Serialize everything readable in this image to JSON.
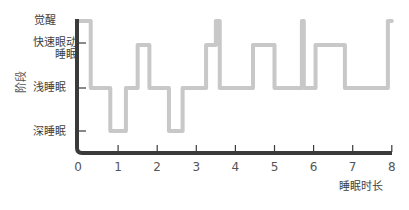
{
  "chart_data": {
    "type": "line",
    "title": "",
    "xlabel": "睡眠时长",
    "ylabel": "阶段",
    "xlim": [
      0,
      8
    ],
    "x_ticks": [
      "0",
      "1",
      "2",
      "3",
      "4",
      "5",
      "6",
      "7",
      "8"
    ],
    "y_categories": [
      "深睡眠",
      "浅睡眠",
      "快速眼动睡眠",
      "觉醒"
    ],
    "y_tick_labels": {
      "awake": "觉醒",
      "rem_line1": "快速眼动",
      "rem_line2": "睡眠",
      "light": "浅睡眠",
      "deep": "深睡眠"
    },
    "grid": false,
    "legend": null,
    "series": [
      {
        "name": "睡眠阶段",
        "color": "#c8c8c8",
        "step_points": [
          {
            "x": 0.0,
            "stage": "觉醒"
          },
          {
            "x": 0.3,
            "stage": "浅睡眠"
          },
          {
            "x": 0.8,
            "stage": "深睡眠"
          },
          {
            "x": 1.2,
            "stage": "浅睡眠"
          },
          {
            "x": 1.5,
            "stage": "快速眼动睡眠"
          },
          {
            "x": 1.8,
            "stage": "浅睡眠"
          },
          {
            "x": 2.3,
            "stage": "深睡眠"
          },
          {
            "x": 2.65,
            "stage": "浅睡眠"
          },
          {
            "x": 3.25,
            "stage": "快速眼动睡眠"
          },
          {
            "x": 3.5,
            "stage": "觉醒"
          },
          {
            "x": 3.6,
            "stage": "浅睡眠"
          },
          {
            "x": 4.45,
            "stage": "快速眼动睡眠"
          },
          {
            "x": 5.0,
            "stage": "浅睡眠"
          },
          {
            "x": 5.7,
            "stage": "觉醒"
          },
          {
            "x": 5.75,
            "stage": "浅睡眠"
          },
          {
            "x": 6.05,
            "stage": "快速眼动睡眠"
          },
          {
            "x": 6.8,
            "stage": "浅睡眠"
          },
          {
            "x": 7.9,
            "stage": "觉醒"
          },
          {
            "x": 8.0,
            "stage": "觉醒"
          }
        ]
      }
    ]
  },
  "colors": {
    "axis": "#3a3a3a",
    "curve": "#c8c8c8",
    "text": "#3f3f3f"
  }
}
